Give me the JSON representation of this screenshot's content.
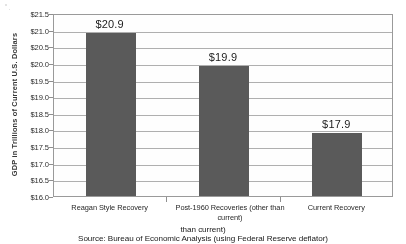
{
  "chart_data": {
    "type": "bar",
    "title": "",
    "xlabel": "",
    "ylabel": "GDP in Trillions of Current U.S. Dollars",
    "categories": [
      "Reagan Style Recovery",
      "Post-1960 Recoveries (other than current)",
      "Current Recovery"
    ],
    "values": [
      20.9,
      19.9,
      17.9
    ],
    "data_labels": [
      "$20.9",
      "$19.9",
      "$17.9"
    ],
    "ylim": [
      16.0,
      21.5
    ],
    "ytick_step": 0.5,
    "ytick_labels": [
      "$21.5",
      "$21.0",
      "$20.5",
      "$20.0",
      "$19.5",
      "$19.0",
      "$18.5",
      "$18.0",
      "$17.5",
      "$17.0",
      "$16.5",
      "$16.0"
    ],
    "ytick_values": [
      21.5,
      21.0,
      20.5,
      20.0,
      19.5,
      19.0,
      18.5,
      18.0,
      17.5,
      17.0,
      16.5,
      16.0
    ],
    "grid": true,
    "legend": false,
    "bar_color": "#5c5c5c",
    "plot_border_color": "#9a9a9a",
    "gridline_color": "#aeaeae"
  },
  "source": {
    "line1": "than current)",
    "text": "Source: Bureau of Economic Analysis (using Federal Reserve deflator)"
  }
}
